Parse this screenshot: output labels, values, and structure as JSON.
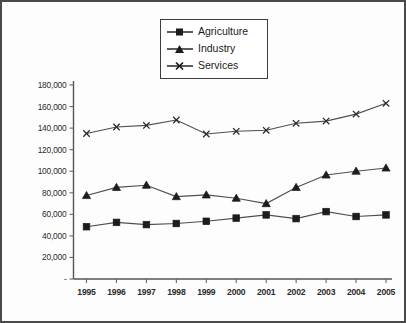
{
  "chart_data": {
    "type": "line",
    "title": "",
    "subtitle": "",
    "xlabel": "",
    "ylabel": "",
    "grid": false,
    "legend_position": "top-center",
    "categories": [
      "1995",
      "1996",
      "1997",
      "1998",
      "1999",
      "2000",
      "2001",
      "2002",
      "2003",
      "2004",
      "2005"
    ],
    "ylim": [
      0,
      180000
    ],
    "ytick_values": [
      0,
      20000,
      40000,
      60000,
      80000,
      100000,
      120000,
      140000,
      160000,
      180000
    ],
    "ytick_labels": [
      "-",
      "20,000",
      "40,000",
      "60,000",
      "80,000",
      "100,000",
      "120,000",
      "140,000",
      "160,000",
      "180,000"
    ],
    "series": [
      {
        "name": "Agriculture",
        "marker": "square",
        "values": [
          48500,
          52500,
          50500,
          51500,
          53500,
          56500,
          59500,
          56000,
          62500,
          58000,
          59500
        ]
      },
      {
        "name": "Industry",
        "marker": "triangle",
        "values": [
          77500,
          85000,
          87000,
          76500,
          78000,
          75000,
          70000,
          85000,
          96500,
          100000,
          103000
        ]
      },
      {
        "name": "Services",
        "marker": "x",
        "values": [
          135000,
          141000,
          142500,
          147500,
          134500,
          137000,
          138000,
          144500,
          146500,
          153000,
          163000
        ]
      }
    ]
  },
  "legend": {
    "items": [
      {
        "label": "Agriculture",
        "marker": "square"
      },
      {
        "label": "Industry",
        "marker": "triangle"
      },
      {
        "label": "Services",
        "marker": "x"
      }
    ]
  }
}
